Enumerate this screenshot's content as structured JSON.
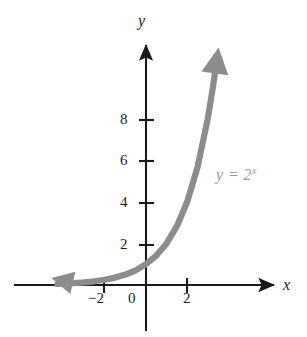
{
  "chart_data": {
    "type": "line",
    "title": "",
    "xlabel": "x",
    "ylabel": "y",
    "annotation": "y = 2",
    "annotation_exponent": "x",
    "function": "y = 2^x",
    "grid": false,
    "legend": "none",
    "xlim": [
      -4.3,
      6.4
    ],
    "ylim": [
      -0.6,
      11.8
    ],
    "x_ticks": [
      -2,
      0,
      2
    ],
    "x_tick_labels": [
      "−2",
      "0",
      "2"
    ],
    "y_ticks": [
      2,
      4,
      6,
      8
    ],
    "y_tick_labels": [
      "2",
      "4",
      "6",
      "8"
    ],
    "series": [
      {
        "name": "y = 2^x",
        "color": "#8c8c8c",
        "arrow_start": true,
        "arrow_end": true,
        "x": [
          -4.3,
          -4.0,
          -3.5,
          -3.0,
          -2.5,
          -2.0,
          -1.5,
          -1.0,
          -0.5,
          0.0,
          0.5,
          1.0,
          1.5,
          2.0,
          2.5,
          3.0,
          3.25,
          3.4
        ],
        "y": [
          0.05,
          0.0625,
          0.088,
          0.125,
          0.177,
          0.25,
          0.354,
          0.5,
          0.707,
          1.0,
          1.414,
          2.0,
          2.828,
          4.0,
          5.657,
          8.0,
          9.51,
          10.56
        ]
      }
    ],
    "axes": {
      "x_axis_arrow": "right",
      "y_axis_arrow": "up",
      "axis_color": "#1a1a1a",
      "origin_label": "0"
    }
  },
  "labels": {
    "y_axis": "y",
    "x_axis": "x",
    "tick_8": "8",
    "tick_6": "6",
    "tick_4": "4",
    "tick_2": "2",
    "tick_0": "0",
    "tick_neg2": "−2",
    "tick_x2": "2",
    "curve_base": "y = 2",
    "curve_exponent": "x"
  },
  "colors": {
    "curve": "#8c8c8c",
    "axis": "#1a1a1a",
    "label": "#9a9a9a",
    "background": "#ffffff"
  }
}
